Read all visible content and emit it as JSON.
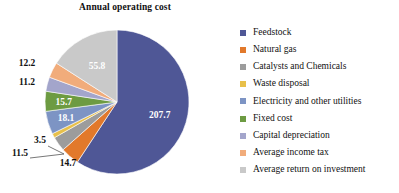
{
  "chart_data": {
    "type": "pie",
    "title": "Annual operating cost",
    "xlabel": "",
    "ylabel": "",
    "legend_position": "right",
    "grid": false,
    "total": 350.4,
    "categories": [
      "Feedstock",
      "Natural gas",
      "Catalysts and Chemicals",
      "Waste disposal",
      "Electricity and other utilities",
      "Fixed cost",
      "Capital depreciation",
      "Average income tax",
      "Average return on investment"
    ],
    "values": [
      207.7,
      14.7,
      11.5,
      3.5,
      18.1,
      15.7,
      11.2,
      12.2,
      55.8
    ],
    "labels": [
      "207.7",
      "14.7",
      "11.5",
      "3.5",
      "18.1",
      "15.7",
      "11.2",
      "12.2",
      "55.8"
    ],
    "colors": [
      "#4f5796",
      "#e2792b",
      "#9c9c9c",
      "#e8c04a",
      "#7d94c4",
      "#6d9b42",
      "#a3a5cb",
      "#f1ac7b",
      "#c9c9c9"
    ],
    "label_placement": [
      "inside",
      "outside",
      "outside",
      "outside",
      "inside",
      "inside",
      "outside",
      "outside",
      "inside"
    ],
    "slices": [
      {
        "name": "Feedstock",
        "value": 207.7,
        "label": "207.7",
        "color": "#4f5796"
      },
      {
        "name": "Natural gas",
        "value": 14.7,
        "label": "14.7",
        "color": "#e2792b"
      },
      {
        "name": "Catalysts and Chemicals",
        "value": 11.5,
        "label": "11.5",
        "color": "#9c9c9c"
      },
      {
        "name": "Waste disposal",
        "value": 3.5,
        "label": "3.5",
        "color": "#e8c04a"
      },
      {
        "name": "Electricity and other utilities",
        "value": 18.1,
        "label": "18.1",
        "color": "#7d94c4"
      },
      {
        "name": "Fixed cost",
        "value": 15.7,
        "label": "15.7",
        "color": "#6d9b42"
      },
      {
        "name": "Capital depreciation",
        "value": 11.2,
        "label": "11.2",
        "color": "#a3a5cb"
      },
      {
        "name": "Average income tax",
        "value": 12.2,
        "label": "12.2",
        "color": "#f1ac7b"
      },
      {
        "name": "Average return on investment",
        "value": 55.8,
        "label": "55.8",
        "color": "#c9c9c9"
      }
    ]
  },
  "legend": {
    "items": [
      {
        "label": "Feedstock",
        "color": "#4f5796"
      },
      {
        "label": "Natural gas",
        "color": "#e2792b"
      },
      {
        "label": "Catalysts and Chemicals",
        "color": "#9c9c9c"
      },
      {
        "label": "Waste disposal",
        "color": "#e8c04a"
      },
      {
        "label": "Electricity and other utilities",
        "color": "#7d94c4"
      },
      {
        "label": "Fixed cost",
        "color": "#6d9b42"
      },
      {
        "label": "Capital depreciation",
        "color": "#a3a5cb"
      },
      {
        "label": "Average income tax",
        "color": "#f1ac7b"
      },
      {
        "label": "Average return on investment",
        "color": "#c9c9c9"
      }
    ]
  }
}
